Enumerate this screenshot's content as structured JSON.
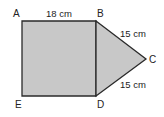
{
  "figure": {
    "vertices": {
      "A": {
        "label": "A"
      },
      "B": {
        "label": "B"
      },
      "C": {
        "label": "C"
      },
      "D": {
        "label": "D"
      },
      "E": {
        "label": "E"
      }
    },
    "measurements": {
      "AB": "18 cm",
      "BC": "15 cm",
      "DC": "15 cm"
    },
    "colors": {
      "fill": "#c8c8c8",
      "stroke": "#2a2a2a"
    }
  }
}
